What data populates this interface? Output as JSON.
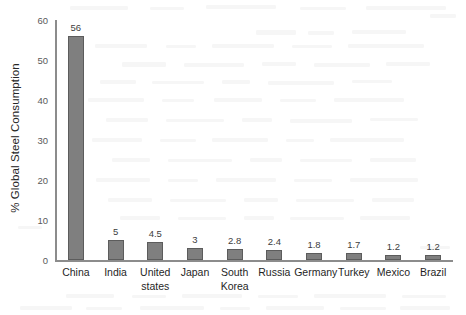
{
  "chart_data": {
    "type": "bar",
    "title": "",
    "subtitle": "",
    "xlabel": "",
    "ylabel": "% Global Steel Consumption",
    "ylim": [
      0,
      60
    ],
    "yticks": [
      0,
      10,
      20,
      30,
      40,
      50,
      60
    ],
    "grid": false,
    "legend": null,
    "orientation": "vertical",
    "bar_color": "#7f7f7f",
    "bar_border_color": "#5c5c5c",
    "axis_color": "#8c8c8c",
    "categories": [
      "China",
      "India",
      "United states",
      "Japan",
      "South Korea",
      "Russia",
      "Germany",
      "Turkey",
      "Mexico",
      "Brazil"
    ],
    "category_lines": [
      [
        "China"
      ],
      [
        "India"
      ],
      [
        "United",
        "states"
      ],
      [
        "Japan"
      ],
      [
        "South",
        "Korea"
      ],
      [
        "Russia"
      ],
      [
        "Germany"
      ],
      [
        "Turkey"
      ],
      [
        "Mexico"
      ],
      [
        "Brazil"
      ]
    ],
    "values": [
      56,
      5,
      4.5,
      3,
      2.8,
      2.4,
      1.8,
      1.7,
      1.2,
      1.2
    ],
    "data_labels": [
      "56",
      "5",
      "4.5",
      "3",
      "2.8",
      "2.4",
      "1.8",
      "1.7",
      "1.2",
      "1.2"
    ]
  },
  "axis": {
    "y_tick_labels": [
      "60",
      "50",
      "40",
      "30",
      "20",
      "10",
      "0"
    ],
    "y_title": "% Global Steel Consumption"
  }
}
